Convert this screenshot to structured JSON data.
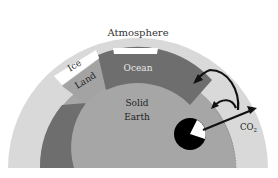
{
  "diagram": {
    "labels": {
      "atmosphere": "Atmosphere",
      "ice": "Ice",
      "land": "Land",
      "ocean": "Ocean",
      "solid_earth_line1": "Solid",
      "solid_earth_line2": "Earth",
      "co2_main": "CO",
      "co2_sub": "2"
    },
    "colors": {
      "background": "#ffffff",
      "atmosphere": "#d9d9d9",
      "ocean": "#6e6e6e",
      "land": "#a3a3a3",
      "ice": "#ffffff",
      "solid_earth": "#a6a6a6",
      "core": "#000000",
      "arrows": "#111111"
    }
  }
}
